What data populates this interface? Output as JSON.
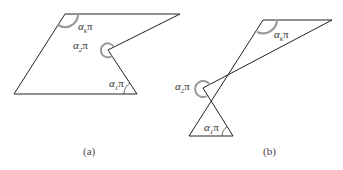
{
  "figures": [
    {
      "id": "a",
      "caption": "(a)",
      "labels": {
        "alpha_k": "α",
        "alpha_k_sub": "k",
        "alpha_2": "α",
        "alpha_2_sub": "2",
        "alpha_1": "α",
        "alpha_1_sub": "1",
        "pi": "π"
      }
    },
    {
      "id": "b",
      "caption": "(b)",
      "labels": {
        "alpha_k": "α",
        "alpha_k_sub": "k",
        "alpha_2": "α",
        "alpha_2_sub": "2",
        "alpha_1": "α",
        "alpha_1_sub": "1",
        "pi": "π"
      }
    }
  ],
  "colors": {
    "line": "#222222",
    "arc": "#999999"
  }
}
